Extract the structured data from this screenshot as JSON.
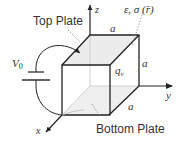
{
  "diagram": {
    "labels": {
      "top_plate": "Top Plate",
      "bottom_plate": "Bottom Plate",
      "voltage": "V",
      "voltage_sub": "0",
      "material": "ε, σ (r̄)",
      "charge": "q",
      "charge_sub": "v",
      "edge_top": "a",
      "edge_right": "a",
      "edge_bottom": "a",
      "axis_x": "x",
      "axis_y": "y",
      "axis_z": "z"
    },
    "colors": {
      "line": "#222222",
      "plate_fill": "#e8e8e8",
      "hidden": "#bbbbbb",
      "text": "#333333"
    }
  }
}
